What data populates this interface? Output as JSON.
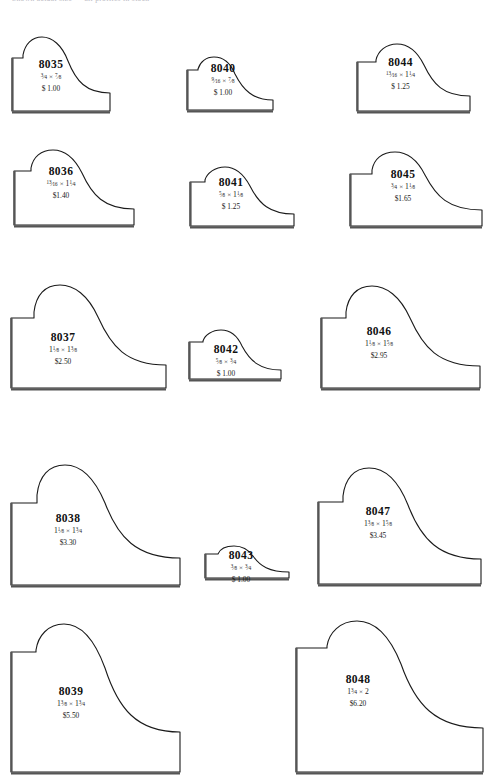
{
  "page": {
    "header_text": "Shown actual size — all profiles in stock",
    "background_color": "#ffffff",
    "outline_color": "#1a1a1a",
    "base_shadow_color": "#555555"
  },
  "items": [
    {
      "code": "8035",
      "dimensions": "3/4 x 7/8",
      "dim_w_num": "3",
      "dim_w_den": "4",
      "dim_w_whole": "",
      "dim_h_num": "7",
      "dim_h_den": "8",
      "dim_h_whole": "",
      "price": "$ 1.00",
      "row": 1,
      "col": 1
    },
    {
      "code": "8040",
      "dimensions": "9/16 x 7/8",
      "dim_w_num": "9",
      "dim_w_den": "16",
      "dim_w_whole": "",
      "dim_h_num": "7",
      "dim_h_den": "8",
      "dim_h_whole": "",
      "price": "$ 1.00",
      "row": 1,
      "col": 2
    },
    {
      "code": "8044",
      "dimensions": "13/16 x 1 1/4",
      "dim_w_num": "13",
      "dim_w_den": "16",
      "dim_w_whole": "",
      "dim_h_num": "1",
      "dim_h_den": "4",
      "dim_h_whole": "1",
      "price": "$ 1.25",
      "row": 1,
      "col": 3
    },
    {
      "code": "8036",
      "dimensions": "13/16 x 1 1/4",
      "dim_w_num": "13",
      "dim_w_den": "16",
      "dim_w_whole": "",
      "dim_h_num": "1",
      "dim_h_den": "4",
      "dim_h_whole": "1",
      "price": "$1.40",
      "row": 2,
      "col": 1
    },
    {
      "code": "8041",
      "dimensions": "5/8 x 1 1/8",
      "dim_w_num": "5",
      "dim_w_den": "8",
      "dim_w_whole": "",
      "dim_h_num": "1",
      "dim_h_den": "8",
      "dim_h_whole": "1",
      "price": "$ 1.25",
      "row": 2,
      "col": 2
    },
    {
      "code": "8045",
      "dimensions": "3/4 x 1 1/8",
      "dim_w_num": "3",
      "dim_w_den": "4",
      "dim_w_whole": "",
      "dim_h_num": "1",
      "dim_h_den": "8",
      "dim_h_whole": "1",
      "price": "$1.65",
      "row": 2,
      "col": 3
    },
    {
      "code": "8037",
      "dimensions": "1 1/8 x 1 3/8",
      "dim_w_num": "1",
      "dim_w_den": "8",
      "dim_w_whole": "1",
      "dim_h_num": "3",
      "dim_h_den": "8",
      "dim_h_whole": "1",
      "price": "$2.50",
      "row": 3,
      "col": 1
    },
    {
      "code": "8042",
      "dimensions": "5/8 x 3/4",
      "dim_w_num": "5",
      "dim_w_den": "8",
      "dim_w_whole": "",
      "dim_h_num": "3",
      "dim_h_den": "4",
      "dim_h_whole": "",
      "price": "$ 1.00",
      "row": 3,
      "col": 2
    },
    {
      "code": "8046",
      "dimensions": "1 1/8 x 1 5/8",
      "dim_w_num": "1",
      "dim_w_den": "8",
      "dim_w_whole": "1",
      "dim_h_num": "5",
      "dim_h_den": "8",
      "dim_h_whole": "1",
      "price": "$2.95",
      "row": 3,
      "col": 3
    },
    {
      "code": "8038",
      "dimensions": "1 1/8 x 1 3/4",
      "dim_w_num": "1",
      "dim_w_den": "8",
      "dim_w_whole": "1",
      "dim_h_num": "3",
      "dim_h_den": "4",
      "dim_h_whole": "1",
      "price": "$3.30",
      "row": 4,
      "col": 1
    },
    {
      "code": "8043",
      "dimensions": "3/8 x 3/4",
      "dim_w_num": "3",
      "dim_w_den": "8",
      "dim_w_whole": "",
      "dim_h_num": "3",
      "dim_h_den": "4",
      "dim_h_whole": "",
      "price": "$ 1.00",
      "row": 4,
      "col": 2
    },
    {
      "code": "8047",
      "dimensions": "1 3/8 x 1 5/8",
      "dim_w_num": "3",
      "dim_w_den": "8",
      "dim_w_whole": "1",
      "dim_h_num": "5",
      "dim_h_den": "8",
      "dim_h_whole": "1",
      "price": "$3.45",
      "row": 4,
      "col": 3
    },
    {
      "code": "8039",
      "dimensions": "1 3/8 x 1 3/4",
      "dim_w_num": "3",
      "dim_w_den": "8",
      "dim_w_whole": "1",
      "dim_h_num": "3",
      "dim_h_den": "4",
      "dim_h_whole": "1",
      "price": "$5.50",
      "row": 5,
      "col": 1
    },
    {
      "code": "8048",
      "dimensions": "1 3/4 x 2",
      "dim_w_num": "3",
      "dim_w_den": "4",
      "dim_w_whole": "1",
      "dim_h_num": "",
      "dim_h_den": "",
      "dim_h_whole": "2",
      "price": "$6.20",
      "row": 5,
      "col": 3
    }
  ]
}
